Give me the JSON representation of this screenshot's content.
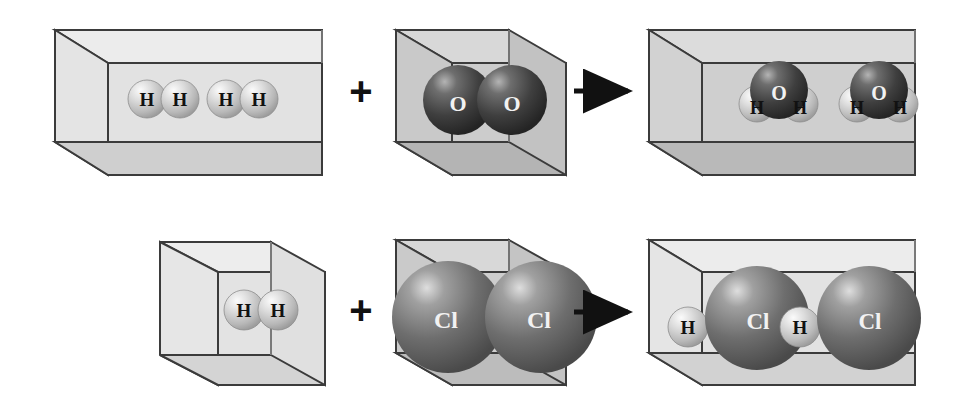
{
  "page": {
    "background_color": "#ffffff"
  },
  "palette": {
    "box_edge": "#3b3b3b",
    "box_face_front": "#d9d9d9",
    "box_face_top": "#e6e6e6",
    "box_face_side": "#cfcfcf",
    "box_face_floor": "#bdbdbd",
    "box_face_front_light": "#e9e9e9",
    "box_face_top_light": "#efefef",
    "hydrogen_sphere": "#c9c9c9",
    "hydrogen_highlight": "#f4f4f4",
    "oxygen_sphere": "#4a4a4a",
    "oxygen_highlight": "#9a9a9a",
    "chlorine_sphere": "#6e6e6e",
    "chlorine_highlight": "#cfcfcf",
    "operator": "#111111",
    "arrow": "#111111",
    "label_dark": "#111111",
    "label_light": "#f2f2f2"
  },
  "atom_labels": {
    "hydrogen": "H",
    "oxygen": "O",
    "chlorine": "Cl"
  },
  "operators": {
    "plus": "+",
    "arrow": "arrow-right-icon"
  },
  "reactions": [
    {
      "id": "water-formation",
      "row": 1,
      "reactant_a": {
        "name": "hydrogen-gas-container",
        "box_shape": "wide-rectangular-prism",
        "molecule_count": 2,
        "molecules": [
          {
            "type": "H2",
            "atoms": [
              "H",
              "H"
            ]
          },
          {
            "type": "H2",
            "atoms": [
              "H",
              "H"
            ]
          }
        ]
      },
      "operator": "+",
      "reactant_b": {
        "name": "oxygen-gas-container",
        "box_shape": "cube",
        "molecule_count": 1,
        "molecules": [
          {
            "type": "O2",
            "atoms": [
              "O",
              "O"
            ]
          }
        ]
      },
      "arrow": "arrow-right-icon",
      "product": {
        "name": "water-vapor-container",
        "box_shape": "wide-rectangular-prism",
        "molecule_count": 2,
        "molecules": [
          {
            "type": "H2O",
            "atoms": [
              "O",
              "H",
              "H"
            ]
          },
          {
            "type": "H2O",
            "atoms": [
              "O",
              "H",
              "H"
            ]
          }
        ]
      }
    },
    {
      "id": "hydrogen-chloride-formation",
      "row": 2,
      "reactant_a": {
        "name": "hydrogen-gas-container",
        "box_shape": "cube",
        "molecule_count": 1,
        "molecules": [
          {
            "type": "H2",
            "atoms": [
              "H",
              "H"
            ]
          }
        ]
      },
      "operator": "+",
      "reactant_b": {
        "name": "chlorine-gas-container",
        "box_shape": "cube",
        "molecule_count": 1,
        "molecules": [
          {
            "type": "Cl2",
            "atoms": [
              "Cl",
              "Cl"
            ]
          }
        ]
      },
      "arrow": "arrow-right-icon",
      "product": {
        "name": "hydrogen-chloride-container",
        "box_shape": "wide-rectangular-prism",
        "molecule_count": 2,
        "molecules": [
          {
            "type": "HCl",
            "atoms": [
              "H",
              "Cl"
            ]
          },
          {
            "type": "HCl",
            "atoms": [
              "H",
              "Cl"
            ]
          }
        ]
      }
    }
  ],
  "labels": {
    "r1_h2_a1": "H",
    "r1_h2_a2": "H",
    "r1_h2_b1": "H",
    "r1_h2_b2": "H",
    "r1_o2_1": "O",
    "r1_o2_2": "O",
    "r1_plus": "+",
    "r1_water1_o": "O",
    "r1_water1_h1": "H",
    "r1_water1_h2": "H",
    "r1_water2_o": "O",
    "r1_water2_h1": "H",
    "r1_water2_h2": "H",
    "r2_h2_1": "H",
    "r2_h2_2": "H",
    "r2_plus": "+",
    "r2_cl2_1": "Cl",
    "r2_cl2_2": "Cl",
    "r2_hcl1_h": "H",
    "r2_hcl1_cl": "Cl",
    "r2_hcl2_h": "H",
    "r2_hcl2_cl": "Cl"
  }
}
